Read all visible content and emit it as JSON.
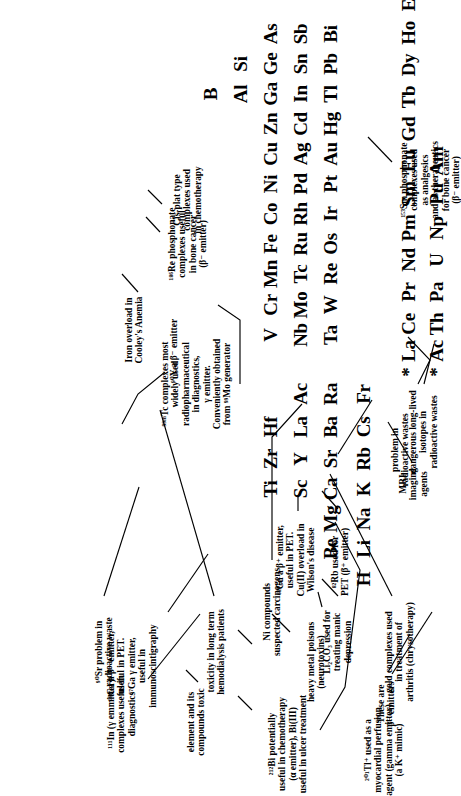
{
  "figure": {
    "type": "annotated-periodic-table",
    "orientation": "rotated-90-ccw"
  },
  "elements": {
    "group1": [
      "H",
      "Li",
      "Na",
      "K",
      "Rb",
      "Cs",
      "Fr"
    ],
    "group2": [
      "Be",
      "Mg",
      "Ca",
      "Sr",
      "Ba",
      "Ra"
    ],
    "group3": [
      "Sc",
      "Y",
      "La",
      "Ac"
    ],
    "group4": [
      "Ti",
      "Zr",
      "Hf"
    ],
    "group5": [
      "V",
      "Nb",
      "Ta"
    ],
    "group6": [
      "Cr",
      "Mo",
      "W"
    ],
    "group7": [
      "Mn",
      "Tc",
      "Re"
    ],
    "group8": [
      "Fe",
      "Ru",
      "Os"
    ],
    "group9": [
      "Co",
      "Rh",
      "Ir"
    ],
    "group10": [
      "Ni",
      "Pd",
      "Pt"
    ],
    "group11": [
      "Cu",
      "Ag",
      "Au"
    ],
    "group12": [
      "Zn",
      "Cd",
      "Hg"
    ],
    "group13": [
      "B",
      "Al",
      "Ga",
      "In",
      "Tl"
    ],
    "group14": [
      "Si",
      "Ge",
      "Sn",
      "Pb"
    ],
    "group15": [
      "As",
      "Sb",
      "Bi"
    ],
    "lanthanides": [
      "La",
      "Ce",
      "Pr",
      "Nd",
      "Pm",
      "Sm",
      "Eu",
      "Gd",
      "Tb",
      "Dy",
      "Ho",
      "Er",
      "Tm",
      "Yb",
      "Lu"
    ],
    "actinides": [
      "Ac",
      "Th",
      "Pa",
      "U",
      "Np",
      "Pu",
      "Am"
    ],
    "lanthanide_marker": "*",
    "actinide_marker": "*"
  },
  "annotations": {
    "li_carbonate": "Li₂CO₃ used for\ntreating manic\ndepression",
    "sr90": "⁹⁰Sr problem in\nradioactive waste",
    "rb82": "⁸²Rb used for\nPET (β⁺ emitter)",
    "cs_problem": "problem in\nradioactive wastes",
    "y90": "⁹⁰Y a β⁻ emitter",
    "tc99m": "⁹⁹ᵐTc complexes most\nwidely used\nradiopharmaceutical\nin diagnostics,\nγ emitter.\nConveniently obtained\nfrom ⁹⁹Mo generator",
    "fe_cooleys": "Iron overload in\nCooley's Anemia",
    "re186": "¹⁸⁶Re phosphonate\ncomplexes useful\nin bone cancer\n(β⁻ emitter)",
    "cisplatin": "Cis-plat type\ncomplexes used\nin chemotherapy",
    "ni_carcinogens": "Ni compounds\nsuspected carcinogens",
    "al_toxicity": "toxicity in long term\nhemodialysis patients",
    "cu62": "⁶²Cu a β⁺ emitter,\nuseful in PET.\nCu(II) overload in\nWilson's disease",
    "heavy_metals": "heavy metal poisons\n(neurotoxins)",
    "ga_pet": "⁶⁸Ga a β⁺ emitter,\nuseful in PET.\n⁶⁷Ga γ emitter,\nuseful in\nimmunoscintigraphy",
    "in111": "¹¹¹In (γ emmitter)\ncomplexes useful in\ndiagnostics",
    "as_toxic": "element and its\ncompounds toxic",
    "bi212": "²¹²Bi potentially\nuseful in chemotherapy\n(α emitter), Bi(III)\nuseful in ulcer treatment",
    "tl201": "²⁰¹Tl⁺ used as a\nmyocardial perfusion\nagent (gamma emitter)\n(a K⁺ mimic)",
    "gold_arthritis": "gold complexes used\nin treatment of\narthritis (chrysotherapy)",
    "beta_emitters": "These are\nβ⁻ emitters",
    "mri": "MRI\nimaging\nagents",
    "actinide_waste": "dangerous long-lived\nisotopes in\nradioactive wastes",
    "sm153": "¹⁵³Sm phosphonate\ncomplexes used\nas analgesics\nand as therapeutics\nfor bone cancer\n(β⁻ emitter)"
  }
}
